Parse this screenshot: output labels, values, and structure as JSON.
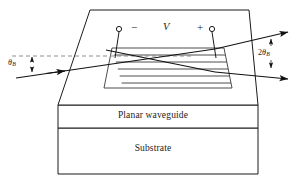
{
  "figure": {
    "kind": "diagram",
    "background_color": "#ffffff",
    "line_color": "#1b1b1b",
    "dashed_line_color": "#8d8d8d"
  },
  "labels": {
    "planar_waveguide": "Planar waveguide",
    "substrate": "Substrate",
    "voltage": "V",
    "minus_terminal": "−",
    "plus_terminal": "+",
    "incident_angle": "θ",
    "incident_angle_sub": "B",
    "diffraction_angle_coef": "2",
    "diffraction_angle": "θ",
    "diffraction_angle_sub": "B"
  },
  "structure": {
    "top_surface": {
      "name": "electrode-top-surface-trapezoid",
      "points": "90,10 249,10 258,105 58,105"
    },
    "waveguide_block": {
      "name": "planar-waveguide-block",
      "x": 58,
      "y": 105,
      "width": 200,
      "height": 23
    },
    "substrate_block": {
      "name": "substrate-block",
      "x": 58,
      "y": 128,
      "width": 200,
      "height": 46
    },
    "grating": {
      "name": "interdigital-grating-trapezoid",
      "points": "112,48 224,48 232,88 104,88",
      "line_count": 5,
      "line_ys": [
        55,
        62,
        69,
        76,
        83
      ]
    },
    "electrodes": {
      "minus_node": {
        "cx": 119,
        "cy": 29,
        "r": 2.6
      },
      "plus_node": {
        "cx": 212,
        "cy": 29,
        "r": 2.6
      },
      "minus_lead": "119,32 115,58",
      "plus_lead": "212,32 216,58"
    }
  },
  "beams": {
    "incident": {
      "name": "incident-beam",
      "from": [
        16,
        78
      ],
      "to": [
        215,
        49
      ],
      "arrow_at": [
        64,
        71
      ]
    },
    "transmitted": {
      "name": "transmitted-beam",
      "from": [
        215,
        49
      ],
      "to": [
        292,
        32
      ]
    },
    "diffracted_in": {
      "name": "diffracted-input-leg",
      "from": [
        112,
        50
      ],
      "to": [
        215,
        72
      ]
    },
    "diffracted_out": {
      "name": "diffracted-beam",
      "from": [
        215,
        72
      ],
      "to": [
        292,
        79
      ]
    },
    "reference_dashed": {
      "name": "optical-axis-dashed",
      "from": [
        12,
        56
      ],
      "to": [
        192,
        56
      ]
    }
  },
  "annotations": {
    "theta_b_left": {
      "name": "incident-bragg-angle-annotation",
      "x": 9,
      "y": 59,
      "arrow_x": 32,
      "arrow_top": 56,
      "arrow_bottom": 74
    },
    "two_theta_b_right": {
      "name": "diffraction-angle-annotation",
      "x": 261,
      "y": 52,
      "arrow_x": 271,
      "arrow_top": 38,
      "arrow_bottom": 70
    }
  }
}
